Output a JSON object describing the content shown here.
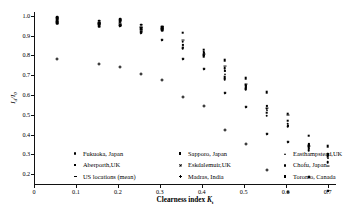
{
  "figure": {
    "background": "#ffffff",
    "foreground": "#000000"
  },
  "axes": {
    "x_title_main": "Clearness index",
    "x_title_symbol": "K",
    "x_title_subscript": "t",
    "y_title": "Id/I0",
    "x_ticks": [
      "0",
      "0.1",
      "0.2",
      "0.3",
      "0.4",
      "0.5",
      "0.6",
      "0.7"
    ],
    "y_ticks": [
      "1.0",
      "0.9",
      "0.8",
      "0.7",
      "0.6",
      "0.5",
      "0.4",
      "0.3",
      "0.2"
    ]
  },
  "legend": {
    "entries": [
      {
        "label": "Fukuoka, Japan",
        "marker": "circle",
        "icon": "circle-marker-icon"
      },
      {
        "label": "Sapporo, Japan",
        "marker": "square",
        "icon": "square-marker-icon"
      },
      {
        "label": "Easthampstead,UK",
        "marker": "triangle",
        "icon": "triangle-marker-icon"
      },
      {
        "label": "Aberporth,UK",
        "marker": "square-sm",
        "icon": "square-small-marker-icon"
      },
      {
        "label": "Eskdalemuir,UK",
        "marker": "x",
        "icon": "x-marker-icon"
      },
      {
        "label": "Chofu, Japan",
        "marker": "circle",
        "icon": "circle-marker-icon"
      },
      {
        "label": "US locations (mean)",
        "marker": "dash",
        "icon": "dash-marker-icon"
      },
      {
        "label": "Madras, India",
        "marker": "plus",
        "icon": "plus-marker-icon"
      },
      {
        "label": "Toronto, Canada",
        "marker": "square",
        "icon": "square-marker-icon"
      }
    ]
  },
  "chart_data": {
    "type": "scatter",
    "title": "",
    "xlabel": "Clearness index Kt",
    "ylabel": "Id/I0",
    "xlim": [
      0,
      0.72
    ],
    "ylim": [
      0.15,
      1.02
    ],
    "grid": false,
    "legend_position": "inside-bottom",
    "series": [
      {
        "name": "Fukuoka, Japan",
        "marker": "circle",
        "points": [
          {
            "x": 0.055,
            "y": 0.995
          },
          {
            "x": 0.155,
            "y": 0.975
          },
          {
            "x": 0.205,
            "y": 0.985
          },
          {
            "x": 0.255,
            "y": 0.955
          },
          {
            "x": 0.305,
            "y": 0.945
          },
          {
            "x": 0.355,
            "y": 0.87
          },
          {
            "x": 0.405,
            "y": 0.82
          },
          {
            "x": 0.455,
            "y": 0.735
          },
          {
            "x": 0.505,
            "y": 0.65
          },
          {
            "x": 0.555,
            "y": 0.53
          },
          {
            "x": 0.605,
            "y": 0.455
          },
          {
            "x": 0.655,
            "y": 0.345
          },
          {
            "x": 0.7,
            "y": 0.3
          }
        ]
      },
      {
        "name": "Sapporo, Japan",
        "marker": "square",
        "points": [
          {
            "x": 0.055,
            "y": 0.985
          },
          {
            "x": 0.155,
            "y": 0.965
          },
          {
            "x": 0.205,
            "y": 0.975
          },
          {
            "x": 0.255,
            "y": 0.94
          },
          {
            "x": 0.305,
            "y": 0.935
          },
          {
            "x": 0.355,
            "y": 0.915
          },
          {
            "x": 0.405,
            "y": 0.83
          },
          {
            "x": 0.455,
            "y": 0.775
          },
          {
            "x": 0.505,
            "y": 0.685
          },
          {
            "x": 0.555,
            "y": 0.615
          },
          {
            "x": 0.605,
            "y": 0.505
          },
          {
            "x": 0.655,
            "y": 0.395
          },
          {
            "x": 0.7,
            "y": 0.34
          }
        ]
      },
      {
        "name": "Easthampstead,UK",
        "marker": "triangle",
        "points": [
          {
            "x": 0.055,
            "y": 0.965
          },
          {
            "x": 0.155,
            "y": 0.955
          },
          {
            "x": 0.205,
            "y": 0.96
          },
          {
            "x": 0.255,
            "y": 0.925
          },
          {
            "x": 0.305,
            "y": 0.93
          },
          {
            "x": 0.355,
            "y": 0.845
          },
          {
            "x": 0.405,
            "y": 0.805
          },
          {
            "x": 0.455,
            "y": 0.705
          },
          {
            "x": 0.505,
            "y": 0.64
          },
          {
            "x": 0.555,
            "y": 0.525
          },
          {
            "x": 0.605,
            "y": 0.45
          },
          {
            "x": 0.655,
            "y": 0.33
          },
          {
            "x": 0.7,
            "y": 0.28
          }
        ]
      },
      {
        "name": "Aberporth,UK",
        "marker": "square-sm",
        "points": [
          {
            "x": 0.055,
            "y": 0.975
          },
          {
            "x": 0.155,
            "y": 0.95
          },
          {
            "x": 0.205,
            "y": 0.97
          },
          {
            "x": 0.255,
            "y": 0.935
          },
          {
            "x": 0.305,
            "y": 0.938
          },
          {
            "x": 0.355,
            "y": 0.855
          },
          {
            "x": 0.405,
            "y": 0.815
          },
          {
            "x": 0.455,
            "y": 0.72
          },
          {
            "x": 0.505,
            "y": 0.645
          },
          {
            "x": 0.555,
            "y": 0.545
          },
          {
            "x": 0.605,
            "y": 0.445
          },
          {
            "x": 0.655,
            "y": 0.35
          },
          {
            "x": 0.7,
            "y": 0.3
          }
        ]
      },
      {
        "name": "Eskdalemuir,UK",
        "marker": "x",
        "points": [
          {
            "x": 0.055,
            "y": 0.99
          },
          {
            "x": 0.155,
            "y": 0.98
          },
          {
            "x": 0.205,
            "y": 0.978
          },
          {
            "x": 0.255,
            "y": 0.96
          },
          {
            "x": 0.305,
            "y": 0.94
          },
          {
            "x": 0.355,
            "y": 0.86
          },
          {
            "x": 0.405,
            "y": 0.825
          },
          {
            "x": 0.455,
            "y": 0.715
          },
          {
            "x": 0.505,
            "y": 0.66
          },
          {
            "x": 0.555,
            "y": 0.54
          },
          {
            "x": 0.605,
            "y": 0.515
          },
          {
            "x": 0.655,
            "y": 0.355
          },
          {
            "x": 0.7,
            "y": 0.295
          }
        ]
      },
      {
        "name": "Chofu, Japan",
        "marker": "circle",
        "points": [
          {
            "x": 0.055,
            "y": 0.96
          },
          {
            "x": 0.155,
            "y": 0.945
          },
          {
            "x": 0.205,
            "y": 0.95
          },
          {
            "x": 0.255,
            "y": 0.92
          },
          {
            "x": 0.305,
            "y": 0.928
          },
          {
            "x": 0.355,
            "y": 0.835
          },
          {
            "x": 0.405,
            "y": 0.8
          },
          {
            "x": 0.455,
            "y": 0.68
          },
          {
            "x": 0.505,
            "y": 0.63
          },
          {
            "x": 0.555,
            "y": 0.495
          },
          {
            "x": 0.605,
            "y": 0.44
          },
          {
            "x": 0.655,
            "y": 0.32
          },
          {
            "x": 0.7,
            "y": 0.26
          }
        ]
      },
      {
        "name": "US locations (mean)",
        "marker": "dash",
        "points": [
          {
            "x": 0.055,
            "y": 0.97
          },
          {
            "x": 0.155,
            "y": 0.96
          },
          {
            "x": 0.205,
            "y": 0.965
          },
          {
            "x": 0.255,
            "y": 0.945
          },
          {
            "x": 0.305,
            "y": 0.932
          },
          {
            "x": 0.355,
            "y": 0.88
          },
          {
            "x": 0.405,
            "y": 0.81
          },
          {
            "x": 0.455,
            "y": 0.745
          },
          {
            "x": 0.505,
            "y": 0.655
          },
          {
            "x": 0.555,
            "y": 0.535
          },
          {
            "x": 0.605,
            "y": 0.5
          },
          {
            "x": 0.655,
            "y": 0.34
          },
          {
            "x": 0.7,
            "y": 0.24
          }
        ]
      },
      {
        "name": "Madras, India",
        "marker": "plus",
        "points": [
          {
            "x": 0.055,
            "y": 0.98
          },
          {
            "x": 0.155,
            "y": 0.97
          },
          {
            "x": 0.205,
            "y": 0.968
          },
          {
            "x": 0.255,
            "y": 0.95
          },
          {
            "x": 0.305,
            "y": 0.936
          },
          {
            "x": 0.355,
            "y": 0.865
          },
          {
            "x": 0.405,
            "y": 0.835
          },
          {
            "x": 0.455,
            "y": 0.725
          },
          {
            "x": 0.505,
            "y": 0.67
          },
          {
            "x": 0.555,
            "y": 0.555
          },
          {
            "x": 0.605,
            "y": 0.46
          },
          {
            "x": 0.655,
            "y": 0.36
          },
          {
            "x": 0.7,
            "y": 0.31
          }
        ]
      },
      {
        "name": "Toronto, Canada",
        "marker": "square",
        "points": [
          {
            "x": 0.055,
            "y": 0.968
          },
          {
            "x": 0.155,
            "y": 0.958
          },
          {
            "x": 0.205,
            "y": 0.955
          },
          {
            "x": 0.255,
            "y": 0.93
          },
          {
            "x": 0.305,
            "y": 0.942
          },
          {
            "x": 0.355,
            "y": 0.84
          },
          {
            "x": 0.405,
            "y": 0.795
          },
          {
            "x": 0.455,
            "y": 0.69
          },
          {
            "x": 0.505,
            "y": 0.635
          },
          {
            "x": 0.555,
            "y": 0.51
          },
          {
            "x": 0.605,
            "y": 0.47
          },
          {
            "x": 0.655,
            "y": 0.335
          },
          {
            "x": 0.7,
            "y": 0.29
          }
        ]
      }
    ]
  }
}
